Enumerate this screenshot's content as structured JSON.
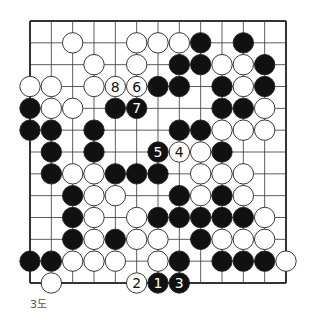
{
  "diagram": {
    "type": "go-board-diagram",
    "caption": "3도",
    "board_size_visible": 13,
    "colors": {
      "black": "#111111",
      "white": "#ffffff",
      "line": "#333333"
    },
    "stones": [
      {
        "col": 2,
        "row": 1,
        "color": "white"
      },
      {
        "col": 5,
        "row": 1,
        "color": "white"
      },
      {
        "col": 6,
        "row": 1,
        "color": "white"
      },
      {
        "col": 7,
        "row": 1,
        "color": "white"
      },
      {
        "col": 8,
        "row": 1,
        "color": "black"
      },
      {
        "col": 10,
        "row": 1,
        "color": "black"
      },
      {
        "col": 3,
        "row": 2,
        "color": "white"
      },
      {
        "col": 5,
        "row": 2,
        "color": "white"
      },
      {
        "col": 7,
        "row": 2,
        "color": "black"
      },
      {
        "col": 8,
        "row": 2,
        "color": "black"
      },
      {
        "col": 9,
        "row": 2,
        "color": "white"
      },
      {
        "col": 10,
        "row": 2,
        "color": "white"
      },
      {
        "col": 11,
        "row": 2,
        "color": "black"
      },
      {
        "col": 0,
        "row": 3,
        "color": "white"
      },
      {
        "col": 1,
        "row": 3,
        "color": "white"
      },
      {
        "col": 3,
        "row": 3,
        "color": "white"
      },
      {
        "col": 4,
        "row": 3,
        "color": "white",
        "label": "8"
      },
      {
        "col": 5,
        "row": 3,
        "color": "white",
        "label": "6"
      },
      {
        "col": 6,
        "row": 3,
        "color": "black"
      },
      {
        "col": 7,
        "row": 3,
        "color": "black"
      },
      {
        "col": 9,
        "row": 3,
        "color": "black"
      },
      {
        "col": 10,
        "row": 3,
        "color": "white"
      },
      {
        "col": 11,
        "row": 3,
        "color": "black"
      },
      {
        "col": 0,
        "row": 4,
        "color": "black"
      },
      {
        "col": 1,
        "row": 4,
        "color": "white"
      },
      {
        "col": 2,
        "row": 4,
        "color": "white"
      },
      {
        "col": 4,
        "row": 4,
        "color": "black"
      },
      {
        "col": 5,
        "row": 4,
        "color": "black",
        "label": "7"
      },
      {
        "col": 9,
        "row": 4,
        "color": "black"
      },
      {
        "col": 10,
        "row": 4,
        "color": "black"
      },
      {
        "col": 11,
        "row": 4,
        "color": "white"
      },
      {
        "col": 0,
        "row": 5,
        "color": "black"
      },
      {
        "col": 1,
        "row": 5,
        "color": "black"
      },
      {
        "col": 3,
        "row": 5,
        "color": "black"
      },
      {
        "col": 7,
        "row": 5,
        "color": "black"
      },
      {
        "col": 8,
        "row": 5,
        "color": "black"
      },
      {
        "col": 9,
        "row": 5,
        "color": "white"
      },
      {
        "col": 10,
        "row": 5,
        "color": "white"
      },
      {
        "col": 11,
        "row": 5,
        "color": "white"
      },
      {
        "col": 1,
        "row": 6,
        "color": "black"
      },
      {
        "col": 3,
        "row": 6,
        "color": "black"
      },
      {
        "col": 6,
        "row": 6,
        "color": "black",
        "label": "5"
      },
      {
        "col": 7,
        "row": 6,
        "color": "white",
        "label": "4"
      },
      {
        "col": 8,
        "row": 6,
        "color": "white"
      },
      {
        "col": 9,
        "row": 6,
        "color": "black"
      },
      {
        "col": 1,
        "row": 7,
        "color": "black"
      },
      {
        "col": 2,
        "row": 7,
        "color": "white"
      },
      {
        "col": 3,
        "row": 7,
        "color": "white"
      },
      {
        "col": 4,
        "row": 7,
        "color": "black"
      },
      {
        "col": 5,
        "row": 7,
        "color": "black"
      },
      {
        "col": 6,
        "row": 7,
        "color": "black"
      },
      {
        "col": 8,
        "row": 7,
        "color": "white"
      },
      {
        "col": 9,
        "row": 7,
        "color": "white"
      },
      {
        "col": 10,
        "row": 7,
        "color": "white"
      },
      {
        "col": 2,
        "row": 8,
        "color": "black"
      },
      {
        "col": 3,
        "row": 8,
        "color": "white"
      },
      {
        "col": 4,
        "row": 8,
        "color": "white"
      },
      {
        "col": 7,
        "row": 8,
        "color": "black"
      },
      {
        "col": 8,
        "row": 8,
        "color": "white"
      },
      {
        "col": 9,
        "row": 8,
        "color": "black"
      },
      {
        "col": 10,
        "row": 8,
        "color": "white"
      },
      {
        "col": 2,
        "row": 9,
        "color": "black"
      },
      {
        "col": 3,
        "row": 9,
        "color": "white"
      },
      {
        "col": 5,
        "row": 9,
        "color": "white"
      },
      {
        "col": 6,
        "row": 9,
        "color": "black"
      },
      {
        "col": 7,
        "row": 9,
        "color": "black"
      },
      {
        "col": 8,
        "row": 9,
        "color": "black"
      },
      {
        "col": 9,
        "row": 9,
        "color": "black"
      },
      {
        "col": 10,
        "row": 9,
        "color": "black"
      },
      {
        "col": 11,
        "row": 9,
        "color": "white"
      },
      {
        "col": 2,
        "row": 10,
        "color": "black"
      },
      {
        "col": 3,
        "row": 10,
        "color": "white"
      },
      {
        "col": 4,
        "row": 10,
        "color": "black"
      },
      {
        "col": 5,
        "row": 10,
        "color": "white"
      },
      {
        "col": 6,
        "row": 10,
        "color": "white"
      },
      {
        "col": 8,
        "row": 10,
        "color": "black"
      },
      {
        "col": 9,
        "row": 10,
        "color": "white"
      },
      {
        "col": 10,
        "row": 10,
        "color": "white"
      },
      {
        "col": 11,
        "row": 10,
        "color": "white"
      },
      {
        "col": 0,
        "row": 11,
        "color": "black"
      },
      {
        "col": 1,
        "row": 11,
        "color": "black"
      },
      {
        "col": 2,
        "row": 11,
        "color": "white"
      },
      {
        "col": 3,
        "row": 11,
        "color": "white"
      },
      {
        "col": 4,
        "row": 11,
        "color": "white"
      },
      {
        "col": 6,
        "row": 11,
        "color": "white"
      },
      {
        "col": 7,
        "row": 11,
        "color": "black"
      },
      {
        "col": 9,
        "row": 11,
        "color": "black"
      },
      {
        "col": 10,
        "row": 11,
        "color": "black"
      },
      {
        "col": 11,
        "row": 11,
        "color": "black"
      },
      {
        "col": 12,
        "row": 11,
        "color": "white"
      },
      {
        "col": 1,
        "row": 12,
        "color": "white"
      },
      {
        "col": 5,
        "row": 12,
        "color": "white",
        "label": "2"
      },
      {
        "col": 6,
        "row": 12,
        "color": "black",
        "label": "1"
      },
      {
        "col": 7,
        "row": 12,
        "color": "black",
        "label": "3"
      }
    ]
  }
}
